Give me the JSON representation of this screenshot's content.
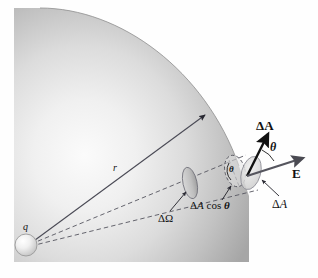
{
  "figure": {
    "kind": "physics-diagram",
    "topic": "Electric flux through a surface element on a sphere due to a point charge",
    "background": "#ffffff",
    "sphere_fill_light": "#f2f2f2",
    "sphere_fill_dark": "#a8a8a8",
    "line_color": "#3b3b4a",
    "arrow_color": "#1a1a1a"
  },
  "labels": {
    "charge": "q",
    "radius": "r",
    "solid_angle": "ΔΩ",
    "projected_area_delta": "Δ",
    "projected_area_a": "A",
    "projected_area_cos": "cos",
    "projected_area_theta": "θ",
    "area_vector": "ΔA",
    "area_scalar_delta": "Δ",
    "area_scalar_a": "A",
    "field_vector": "E",
    "theta_outer": "θ",
    "theta_inner": "θ"
  },
  "elements": {
    "sphere_name": "spherical-gaussian-surface",
    "charge_name": "point-charge-sphere",
    "radius_arrow_name": "radius-arrow",
    "cone_line_upper": "solid-angle-cone-line-upper",
    "cone_line_lower": "solid-angle-cone-line-lower",
    "cone_cross_section": "solid-angle-cross-section-ellipse",
    "projected_patch": "projected-area-ellipse",
    "tilted_patch": "tilted-area-patch-ellipse",
    "normal_arrow": "area-normal-vector-arrow",
    "field_arrow": "electric-field-vector-arrow",
    "theta_arc_outer": "theta-arc-between-normal-and-field",
    "theta_arc_inner": "theta-arc-between-radial-and-patch",
    "pointer_solid_angle": "leader-line-solid-angle",
    "pointer_projected": "leader-line-projected-area",
    "pointer_area": "leader-line-area-scalar"
  }
}
